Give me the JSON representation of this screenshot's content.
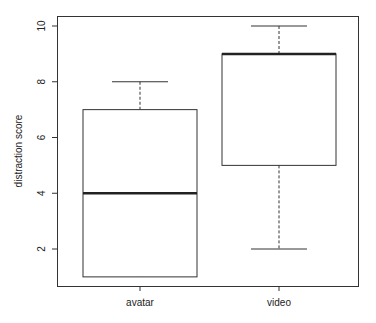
{
  "chart_data": {
    "type": "boxplot",
    "title": "",
    "xlabel": "",
    "ylabel": "distraction score",
    "categories": [
      "avatar",
      "video"
    ],
    "series": [
      {
        "name": "avatar",
        "min": 1,
        "q1": 1,
        "median": 4,
        "q3": 7,
        "max": 8
      },
      {
        "name": "video",
        "min": 2,
        "q1": 5,
        "median": 9,
        "q3": 9,
        "max": 10
      }
    ],
    "yticks": [
      2,
      4,
      6,
      8,
      10
    ],
    "ylim": [
      0.64,
      10.36
    ],
    "grid": false,
    "legend": null
  },
  "colors": {
    "line": "#333333",
    "median": "#222222",
    "background": "#ffffff"
  }
}
